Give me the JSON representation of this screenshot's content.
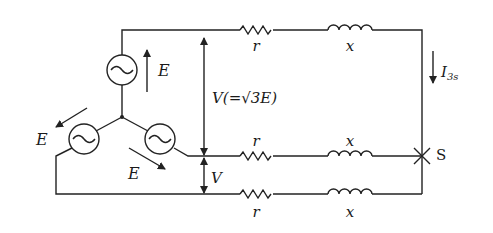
{
  "diagram": {
    "sources": [
      {
        "name": "top",
        "emf_label": "E"
      },
      {
        "name": "left",
        "emf_label": "E"
      },
      {
        "name": "right",
        "emf_label": "E"
      }
    ],
    "lines": [
      {
        "name": "line-a",
        "resistor_label": "r",
        "reactance_label": "x"
      },
      {
        "name": "line-b",
        "resistor_label": "r",
        "reactance_label": "x"
      },
      {
        "name": "line-c",
        "resistor_label": "r",
        "reactance_label": "x"
      }
    ],
    "line_voltage_label": "V(=√3E)",
    "line_voltage_short": "V",
    "current_label_main": "I",
    "current_label_sub": "3s",
    "fault_point_label": "S",
    "colors": {
      "stroke": "#222222",
      "background": "#ffffff"
    }
  }
}
